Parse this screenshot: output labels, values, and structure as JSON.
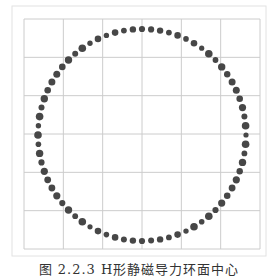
{
  "figure": {
    "caption": "图 2.2.3  H形静磁导力环面中心"
  },
  "chart_data": {
    "type": "scatter",
    "title": "",
    "xlabel": "",
    "ylabel": "",
    "grid": true,
    "grid_divisions": {
      "x": 6,
      "y": 6
    },
    "xlim": [
      -3,
      3
    ],
    "ylim": [
      -3,
      3
    ],
    "point_color": "#4a4a4a",
    "center": [
      0,
      0
    ],
    "radius": 2.6,
    "num_points": 72,
    "points": []
  },
  "colors": {
    "grid": "#cccccc",
    "frame": "#dddddd",
    "dot": "#474747"
  }
}
